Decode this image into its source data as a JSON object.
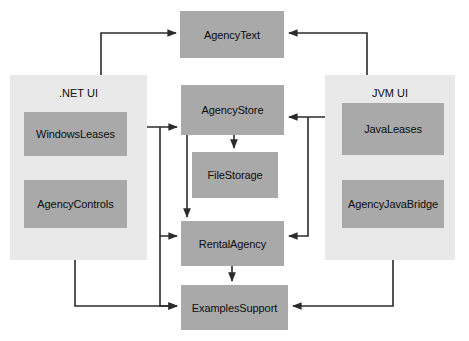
{
  "diagram": {
    "colors": {
      "node_fill": "#a9a9a9",
      "panel_fill": "#e9e9e9",
      "edge": "#2b2b2b",
      "text": "#0d0d0d",
      "background": "#ffffff"
    },
    "panels": [
      {
        "id": "dotnet",
        "label": ".NET UI",
        "x": 10,
        "y": 75,
        "w": 137,
        "h": 185
      },
      {
        "id": "jvm",
        "label": "JVM UI",
        "x": 325,
        "y": 75,
        "w": 130,
        "h": 185
      }
    ],
    "nodes": [
      {
        "id": "agencytext",
        "label": "AgencyText",
        "x": 180,
        "y": 11,
        "w": 104,
        "h": 47
      },
      {
        "id": "agencystore",
        "label": "AgencyStore",
        "x": 181,
        "y": 85,
        "w": 103,
        "h": 50
      },
      {
        "id": "filestorage",
        "label": "FileStorage",
        "x": 192,
        "y": 152,
        "w": 86,
        "h": 46
      },
      {
        "id": "rentalagency",
        "label": "RentalAgency",
        "x": 181,
        "y": 221,
        "w": 103,
        "h": 45
      },
      {
        "id": "examplessupport",
        "label": "ExamplesSupport",
        "x": 181,
        "y": 285,
        "w": 107,
        "h": 45
      },
      {
        "id": "windowsleases",
        "label": "WindowsLeases",
        "x": 24,
        "y": 112,
        "w": 103,
        "h": 44
      },
      {
        "id": "agencycontrols",
        "label": "AgencyControls",
        "x": 24,
        "y": 180,
        "w": 103,
        "h": 48
      },
      {
        "id": "javaleases",
        "label": "JavaLeases",
        "x": 342,
        "y": 103,
        "w": 102,
        "h": 52
      },
      {
        "id": "agencyjavabridge",
        "label": "AgencyJavaBridge",
        "x": 342,
        "y": 180,
        "w": 102,
        "h": 48
      }
    ],
    "edges": [
      {
        "from": "windowsleases",
        "to": "agencytext",
        "points": "101,112 101,33 176,33"
      },
      {
        "from": "javaleases",
        "to": "agencytext",
        "points": "367,103 367,33 289,33"
      },
      {
        "from": "windowsleases",
        "to": "agencystore",
        "points": "127,127 177,127"
      },
      {
        "from": "javaleases",
        "to": "agencystore",
        "points": "342,117 289,117"
      },
      {
        "from": "agencystore",
        "to": "filestorage",
        "points": "234,135 234,148"
      },
      {
        "from": "agencystore",
        "to": "rentalagency",
        "points": "187,135 187,217"
      },
      {
        "from": "windowsleases",
        "to": "rentalagency",
        "points": "160,127 160,236 177,236"
      },
      {
        "from": "windowsleases",
        "to": "examplessupport",
        "points": "160,236 160,306 177,306"
      },
      {
        "from": "javaleases",
        "to": "rentalagency",
        "points": "308,117 308,236 289,236"
      },
      {
        "from": "agencycontrols",
        "to": "examplessupport",
        "points": "75,228 75,306 177,306"
      },
      {
        "from": "agencyjavabridge",
        "to": "examplessupport",
        "points": "393,228 393,306 293,306"
      },
      {
        "from": "windowsleases",
        "to": "agencycontrols",
        "points": "75,156 75,176"
      },
      {
        "from": "rentalagency",
        "to": "examplessupport",
        "points": "232,266 232,281"
      }
    ]
  }
}
